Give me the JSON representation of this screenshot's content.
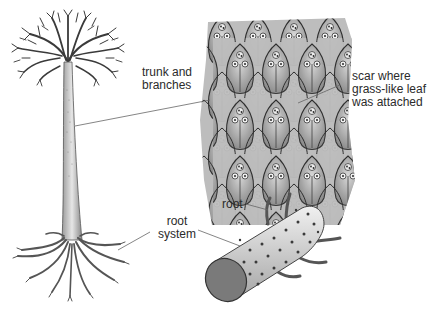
{
  "diagram": {
    "parts": [
      {
        "id": "tree",
        "description": "tall tree with branching crown, trunk and root system"
      },
      {
        "id": "bark-detail",
        "description": "close-up of bark showing diamond-shaped leaf scars"
      },
      {
        "id": "root-fragment",
        "description": "fossil root segment with dotted surface and rootlets"
      }
    ]
  },
  "labels": {
    "trunk": {
      "line1": "trunk and",
      "line2": "branches"
    },
    "scar": {
      "line1": "scar where",
      "line2": "grass-like leaf",
      "line3": "was attached"
    },
    "root_system": {
      "line1": "root",
      "line2": "system"
    },
    "root": {
      "text": "root"
    }
  },
  "colors": {
    "ink": "#2b2b2b",
    "bark_light": "#c8c8c8",
    "bark_dark": "#6a6a6a",
    "root_end": "#7a7a7a",
    "leader_line": "#555555"
  }
}
